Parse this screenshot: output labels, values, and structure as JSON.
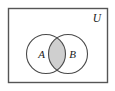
{
  "figure": {
    "type": "venn-diagram",
    "universe": {
      "label": "U",
      "rect": {
        "x": 8,
        "y": 8,
        "width": 100,
        "height": 75
      },
      "border_color": "#555555",
      "fill_color": "#ffffff",
      "label_position": {
        "x": 97,
        "y": 21
      }
    },
    "sets": [
      {
        "id": "A",
        "label": "A",
        "cx": 46,
        "cy": 54,
        "r": 19.5,
        "label_position": {
          "x": 41,
          "y": 58
        },
        "stroke_color": "#4a4a4a",
        "fill_color": "#ffffff"
      },
      {
        "id": "B",
        "label": "B",
        "cx": 68,
        "cy": 54,
        "r": 19.5,
        "label_position": {
          "x": 68,
          "y": 58
        },
        "stroke_color": "#4a4a4a",
        "fill_color": "#ffffff"
      }
    ],
    "intersection": {
      "label": "A intersect B",
      "shaded": true,
      "fill_color": "#cfcfcf",
      "stroke_color": "#4a4a4a"
    }
  }
}
